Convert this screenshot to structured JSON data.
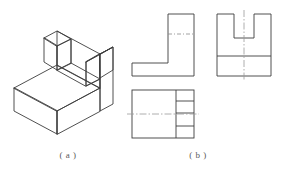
{
  "figure": {
    "background_color": "#ffffff",
    "line_color": "#3c3c3c",
    "centerline_color": "#8a8a8a",
    "caption_color": "#5a5a5a",
    "title": "",
    "captions": {
      "pictorial": "( a )",
      "orthographic": "( b )"
    }
  },
  "views": {
    "pictorial": {
      "name": "isometric-view",
      "label": "( a )",
      "description": "isometric pictorial of U-shaped fork bracket"
    },
    "side": {
      "name": "side-view",
      "description": "L-shaped profile with hidden line",
      "hidden_line": "dashed-centerline"
    },
    "front": {
      "name": "front-view",
      "description": "U-notch profile with vertical centerline and base division line",
      "centerline": "vertical"
    },
    "top": {
      "name": "top-view",
      "description": "rectangle with right column divided into four bands and horizontal centerline",
      "divisions": 4,
      "centerline": "horizontal"
    }
  }
}
